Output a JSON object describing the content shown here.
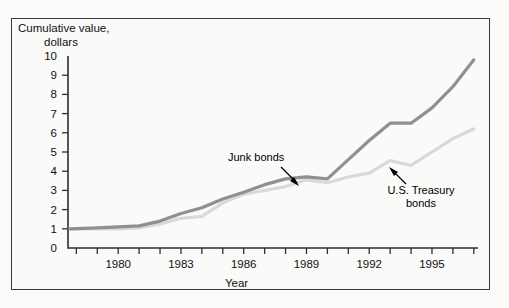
{
  "figure": {
    "y_axis_title_line1": "Cumulative value,",
    "y_axis_title_line2": "dollars",
    "x_axis_title": "Year"
  },
  "annotations": {
    "junk": "Junk bonds",
    "treasury_line1": "U.S. Treasury",
    "treasury_line2": "bonds"
  },
  "colors": {
    "junk_bonds": "#909090",
    "treasury_bonds": "#d9d9d9",
    "axis": "#2f2f2f",
    "background": "#fafaf9",
    "text": "#111111"
  },
  "chart_data": {
    "type": "line",
    "title": "",
    "xlabel": "Year",
    "ylabel": "Cumulative value, dollars",
    "xlim": [
      1977.6,
      1997.2
    ],
    "ylim": [
      0,
      10
    ],
    "yticks": [
      0,
      1,
      2,
      3,
      4,
      5,
      6,
      7,
      8,
      9,
      10
    ],
    "ytick_labels": [
      "0",
      "1",
      "2",
      "3",
      "4",
      "5",
      "6",
      "7",
      "8",
      "9",
      "10"
    ],
    "xticks": [
      1978,
      1979,
      1980,
      1981,
      1982,
      1983,
      1984,
      1985,
      1986,
      1987,
      1988,
      1989,
      1990,
      1991,
      1992,
      1993,
      1994,
      1995,
      1996,
      1997
    ],
    "xtick_labels_shown": [
      "1980",
      "1983",
      "1986",
      "1989",
      "1992",
      "1995"
    ],
    "grid": false,
    "legend": "annotated inline",
    "series": [
      {
        "name": "Junk bonds",
        "color": "#909090",
        "x": [
          1977.7,
          1979.0,
          1980.0,
          1981.0,
          1982.0,
          1983.0,
          1984.0,
          1985.0,
          1986.0,
          1987.0,
          1988.0,
          1989.0,
          1990.0,
          1991.0,
          1992.0,
          1993.0,
          1994.0,
          1995.0,
          1996.0,
          1997.0
        ],
        "y": [
          1.0,
          1.05,
          1.1,
          1.15,
          1.4,
          1.8,
          2.1,
          2.55,
          2.9,
          3.3,
          3.6,
          3.7,
          3.6,
          4.6,
          5.6,
          6.5,
          6.5,
          7.3,
          8.4,
          9.8
        ]
      },
      {
        "name": "U.S. Treasury bonds",
        "color": "#d9d9d9",
        "x": [
          1977.7,
          1979.0,
          1980.0,
          1981.0,
          1982.0,
          1983.0,
          1984.0,
          1985.0,
          1986.0,
          1987.0,
          1988.0,
          1989.0,
          1990.0,
          1991.0,
          1992.0,
          1993.0,
          1994.0,
          1995.0,
          1996.0,
          1997.0
        ],
        "y": [
          1.0,
          1.0,
          1.0,
          1.05,
          1.25,
          1.55,
          1.65,
          2.35,
          2.8,
          3.0,
          3.2,
          3.55,
          3.4,
          3.7,
          3.9,
          4.55,
          4.3,
          5.0,
          5.7,
          6.2
        ]
      }
    ]
  }
}
